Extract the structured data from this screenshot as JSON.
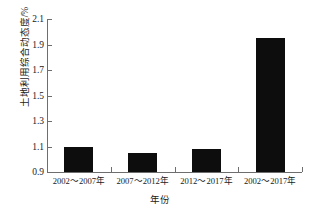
{
  "chart_data": {
    "type": "bar",
    "title": "",
    "subtitle": "",
    "xlabel": "年份",
    "ylabel": "土地利用综合动态度/%",
    "categories": [
      "2002～2007年",
      "2007～2012年",
      "2012～2017年",
      "2002～2017年"
    ],
    "values": [
      1.1,
      1.05,
      1.08,
      1.95
    ],
    "series": [
      {
        "name": "土地利用综合动态度",
        "values": [
          1.1,
          1.05,
          1.08,
          1.95
        ]
      }
    ],
    "ylim": [
      0.9,
      2.1
    ],
    "y_ticks": [
      "0.9",
      "1.1",
      "1.3",
      "1.5",
      "1.7",
      "1.9",
      "2.1"
    ],
    "y_tick_values": [
      0.9,
      1.1,
      1.3,
      1.5,
      1.7,
      1.9,
      2.1
    ],
    "grid": false,
    "legend": false,
    "legend_position": "none",
    "bar_color": "#0d0d0d",
    "axis_color": "#6e6e6e",
    "background_color": "#ffffff"
  }
}
